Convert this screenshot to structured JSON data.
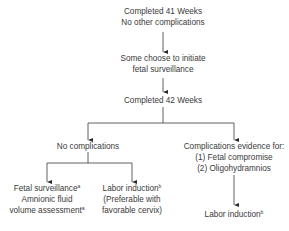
{
  "nodes": {
    "completed_41": {
      "line1": "Completed 41 Weeks",
      "line2": "No other complications"
    },
    "surveillance_choice": {
      "line1": "Some choose to initiate",
      "line2": "fetal surveillance"
    },
    "completed_42": {
      "line1": "Completed 42 Weeks"
    },
    "no_complications": {
      "line1": "No complications"
    },
    "complications": {
      "line1": "Complications evidence for:",
      "line2": "(1) Fetal compromise",
      "line3": "(2) Oligohydramnios"
    },
    "fetal_surveillance": {
      "line1": "Fetal surveillance",
      "sup1": "a",
      "line2": "Amnionic fluid",
      "line3": "volume assessment",
      "sup3": "a"
    },
    "labor_induction_left": {
      "line1": "Labor induction",
      "sup1": "b",
      "line2": "(Preferable with",
      "line3": "favorable cervix)"
    },
    "labor_induction_right": {
      "line1": "Labor induction",
      "sup1": "b"
    }
  },
  "colors": {
    "line": "#3a3a3a",
    "text": "#3a3a3a"
  }
}
